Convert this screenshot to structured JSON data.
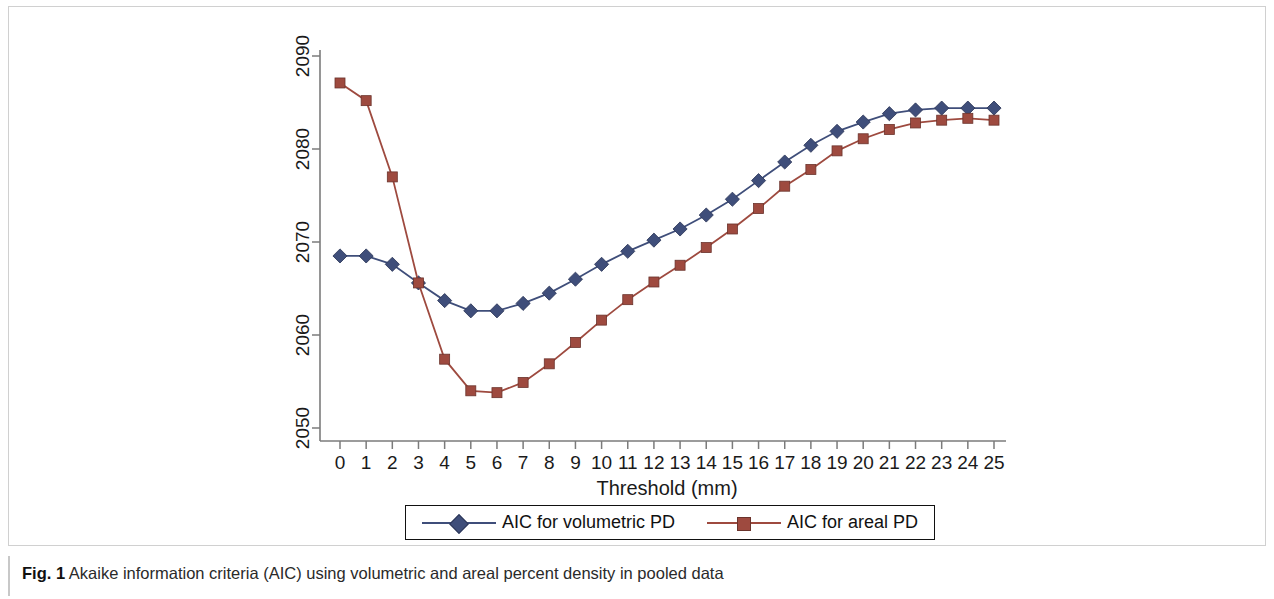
{
  "figure": {
    "caption_label": "Fig. 1",
    "caption_text": "Akaike information criteria (AIC) using volumetric and areal percent density in pooled data"
  },
  "legend": {
    "entries": [
      {
        "label": "AIC for volumetric PD",
        "color": "#3f4e7a",
        "marker": "diamond"
      },
      {
        "label": "AIC for areal PD",
        "color": "#9e4a3f",
        "marker": "square"
      }
    ]
  },
  "chart_data": {
    "type": "line",
    "title": "",
    "subtitle": "",
    "xlabel": "Threshold (mm)",
    "ylabel": "",
    "grid": false,
    "legend_position": "bottom",
    "xlim": [
      0,
      25
    ],
    "ylim": [
      2048,
      2092
    ],
    "xticks": [
      0,
      1,
      2,
      3,
      4,
      5,
      6,
      7,
      8,
      9,
      10,
      11,
      12,
      13,
      14,
      15,
      16,
      17,
      18,
      19,
      20,
      21,
      22,
      23,
      24,
      25
    ],
    "xtick_labels": [
      "0",
      "1",
      "2",
      "3",
      "4",
      "5",
      "6",
      "7",
      "8",
      "9",
      "10",
      "11",
      "12",
      "13",
      "14",
      "15",
      "16",
      "17",
      "18",
      "19",
      "20",
      "21",
      "22",
      "23",
      "24",
      "25"
    ],
    "yticks": [
      2050,
      2060,
      2070,
      2080,
      2090
    ],
    "ytick_labels": [
      "2050",
      "2060",
      "2070",
      "2080",
      "2090"
    ],
    "x": [
      0,
      1,
      2,
      3,
      4,
      5,
      6,
      7,
      8,
      9,
      10,
      11,
      12,
      13,
      14,
      15,
      16,
      17,
      18,
      19,
      20,
      21,
      22,
      23,
      24,
      25
    ],
    "series": [
      {
        "name": "AIC for volumetric PD",
        "color": "#3f4e7a",
        "marker": "diamond",
        "values": [
          2068.5,
          2068.5,
          2067.6,
          2065.6,
          2063.7,
          2062.6,
          2062.6,
          2063.4,
          2064.5,
          2066.0,
          2067.6,
          2069.0,
          2070.2,
          2071.4,
          2072.9,
          2074.6,
          2076.6,
          2078.6,
          2080.4,
          2081.9,
          2082.9,
          2083.8,
          2084.2,
          2084.4,
          2084.4,
          2084.4
        ]
      },
      {
        "name": "AIC for areal PD",
        "color": "#9e4a3f",
        "marker": "square",
        "values": [
          2087.1,
          2085.2,
          2077.0,
          2065.6,
          2057.4,
          2054.0,
          2053.8,
          2054.9,
          2056.9,
          2059.2,
          2061.6,
          2063.8,
          2065.7,
          2067.5,
          2069.4,
          2071.4,
          2073.6,
          2076.0,
          2077.8,
          2079.8,
          2081.1,
          2082.1,
          2082.8,
          2083.1,
          2083.3,
          2083.1
        ]
      }
    ]
  }
}
